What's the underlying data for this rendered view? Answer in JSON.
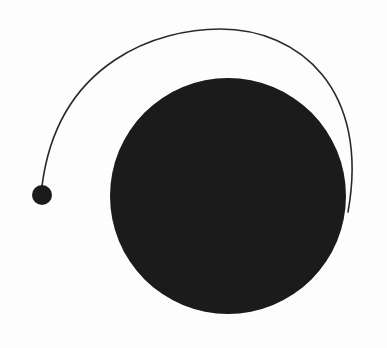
{
  "canvas": {
    "width": 387,
    "height": 348,
    "background": "#fdfdfd"
  },
  "diagram": {
    "large_circle": {
      "cx": 228,
      "cy": 196,
      "r": 118,
      "fill": "#1b1b1b"
    },
    "small_dot": {
      "cx": 42,
      "cy": 195,
      "r": 10,
      "fill": "#1b1b1b"
    },
    "arc": {
      "start": [
        42,
        186
      ],
      "control1": [
        58,
        60
      ],
      "control2": [
        160,
        29
      ],
      "mid": [
        220,
        29
      ],
      "control3": [
        300,
        29
      ],
      "control4": [
        370,
        90
      ],
      "end": [
        348,
        212
      ],
      "stroke": "#2a2a2a",
      "stroke_width": 1.6
    }
  }
}
